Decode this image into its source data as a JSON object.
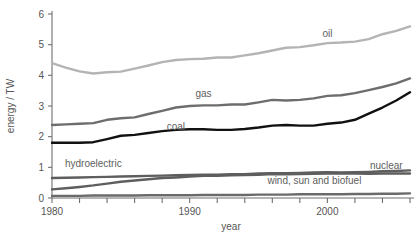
{
  "chart_data": {
    "type": "line",
    "title": "",
    "xlabel": "year",
    "ylabel": "energy / TW",
    "xlim": [
      1980,
      2006
    ],
    "ylim": [
      0,
      6.2
    ],
    "grid": false,
    "legend_position": "inline-labels",
    "x_tick_labels": [
      "1980",
      "1990",
      "2000"
    ],
    "x_labeled_ticks": [
      1980,
      1990,
      2000
    ],
    "x_minor_tick_step": 2,
    "y_tick_labels": [
      "0",
      "1",
      "2",
      "3",
      "4",
      "5",
      "6"
    ],
    "y_ticks": [
      0,
      1,
      2,
      3,
      4,
      5,
      6
    ],
    "x": [
      1980,
      1981,
      1982,
      1983,
      1984,
      1985,
      1986,
      1987,
      1988,
      1989,
      1990,
      1991,
      1992,
      1993,
      1994,
      1995,
      1996,
      1997,
      1998,
      1999,
      2000,
      2001,
      2002,
      2003,
      2004,
      2005,
      2006
    ],
    "series": [
      {
        "name": "oil",
        "color": "#b4b4b4",
        "label_x": 2000,
        "label_y": 5.25,
        "values": [
          4.4,
          4.25,
          4.13,
          4.06,
          4.1,
          4.12,
          4.22,
          4.32,
          4.43,
          4.5,
          4.53,
          4.54,
          4.58,
          4.58,
          4.65,
          4.72,
          4.81,
          4.9,
          4.92,
          4.98,
          5.05,
          5.07,
          5.1,
          5.18,
          5.34,
          5.45,
          5.6
        ]
      },
      {
        "name": "gas",
        "color": "#6d6d6d",
        "label_x": 1991,
        "label_y": 3.28,
        "values": [
          2.38,
          2.4,
          2.42,
          2.44,
          2.55,
          2.6,
          2.63,
          2.74,
          2.84,
          2.95,
          3.0,
          3.02,
          3.02,
          3.05,
          3.05,
          3.12,
          3.2,
          3.18,
          3.2,
          3.25,
          3.33,
          3.35,
          3.42,
          3.52,
          3.62,
          3.74,
          3.9
        ]
      },
      {
        "name": "coal",
        "color": "#111111",
        "label_x": 1989,
        "label_y": 2.22,
        "values": [
          1.8,
          1.8,
          1.8,
          1.82,
          1.92,
          2.03,
          2.06,
          2.12,
          2.18,
          2.22,
          2.24,
          2.24,
          2.22,
          2.22,
          2.25,
          2.3,
          2.36,
          2.38,
          2.36,
          2.36,
          2.42,
          2.46,
          2.55,
          2.75,
          2.95,
          3.18,
          3.45
        ]
      },
      {
        "name": "hydroelectric",
        "color": "#5e5e5e",
        "label_x": 1983,
        "label_y": 1.02,
        "values": [
          0.65,
          0.66,
          0.67,
          0.68,
          0.69,
          0.7,
          0.71,
          0.72,
          0.73,
          0.74,
          0.75,
          0.76,
          0.76,
          0.78,
          0.78,
          0.8,
          0.81,
          0.81,
          0.82,
          0.83,
          0.84,
          0.83,
          0.84,
          0.85,
          0.87,
          0.88,
          0.9
        ]
      },
      {
        "name": "nuclear",
        "color": "#5e5e5e",
        "label_x": 2003,
        "label_y": 0.94,
        "values": [
          0.28,
          0.32,
          0.36,
          0.41,
          0.47,
          0.53,
          0.57,
          0.61,
          0.65,
          0.67,
          0.7,
          0.72,
          0.72,
          0.74,
          0.75,
          0.76,
          0.78,
          0.77,
          0.78,
          0.79,
          0.8,
          0.8,
          0.8,
          0.79,
          0.8,
          0.8,
          0.8
        ]
      },
      {
        "name": "wind, sun and biofuel",
        "color": "#6a6a6a",
        "label_x": 2000,
        "label_y": 0.46,
        "values": [
          0.07,
          0.07,
          0.07,
          0.08,
          0.08,
          0.08,
          0.08,
          0.09,
          0.09,
          0.09,
          0.09,
          0.1,
          0.1,
          0.1,
          0.1,
          0.11,
          0.11,
          0.11,
          0.12,
          0.12,
          0.12,
          0.12,
          0.13,
          0.13,
          0.14,
          0.14,
          0.15
        ]
      }
    ]
  }
}
